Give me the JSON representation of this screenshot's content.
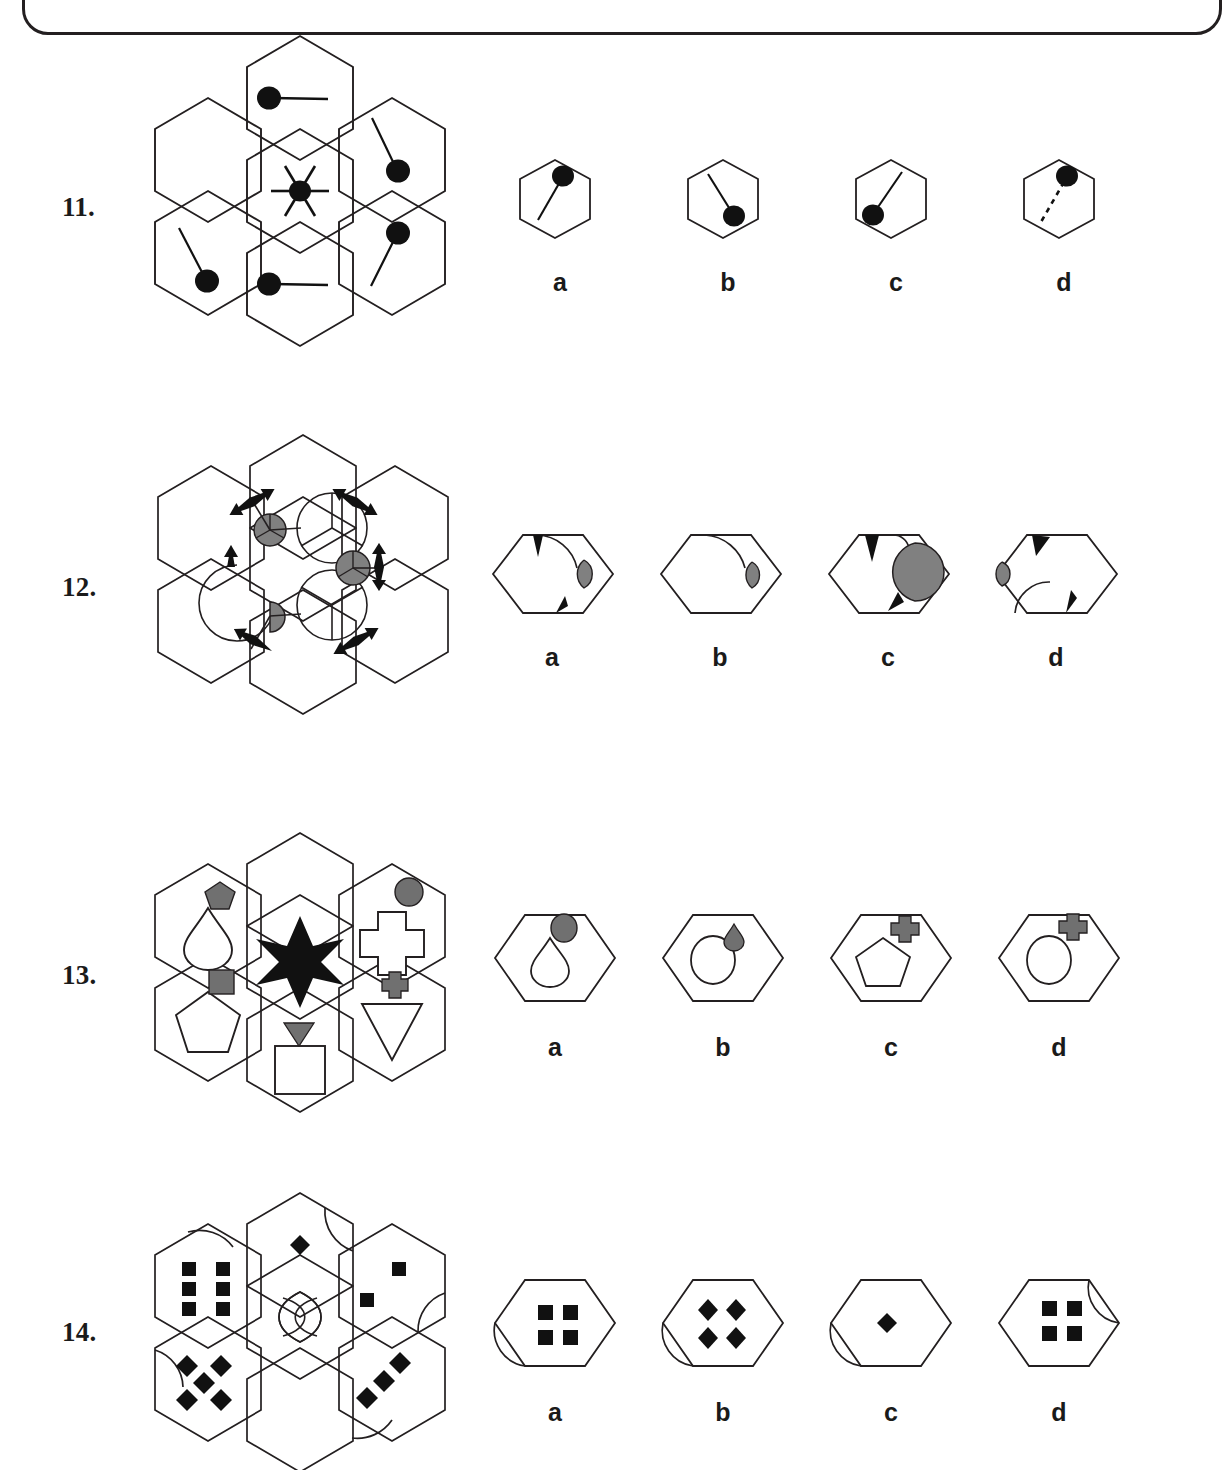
{
  "page": {
    "border": "rounded-rectangle-top",
    "background_color": "#ffffff",
    "ink_color": "#231f20",
    "gray_fill": "#808080",
    "gray_fill_dark": "#707070"
  },
  "questions": [
    {
      "number": "11.",
      "matrix_type": "hexagon-flower-7",
      "description": "Seven hexagons in a flower arrangement; centre hexagon has a filled dot with six radiating spokes; five outer hexagons each contain a filled dot with a single tail line; the upper-left hexagon is empty (the missing piece).",
      "cells": [
        {
          "position": "top",
          "content": "dot-with-line-right"
        },
        {
          "position": "upper-right",
          "content": "dot-with-line-up-left"
        },
        {
          "position": "lower-right",
          "content": "dot-with-line-down-left"
        },
        {
          "position": "bottom",
          "content": "dot-with-line-right"
        },
        {
          "position": "lower-left",
          "content": "dot-with-line-up-right"
        },
        {
          "position": "upper-left",
          "content": "empty"
        },
        {
          "position": "center",
          "content": "dot-with-six-spokes"
        }
      ],
      "options": [
        {
          "label": "a",
          "content": "dot-top-right-with-line-to-lower-left"
        },
        {
          "label": "b",
          "content": "dot-lower-right-with-line-to-upper-left"
        },
        {
          "label": "c",
          "content": "dot-lower-left-with-line-to-upper-right"
        },
        {
          "label": "d",
          "content": "dot-top-right-with-dashed-line-to-lower-left"
        }
      ]
    },
    {
      "number": "12.",
      "matrix_type": "hexagon-flower-7",
      "description": "Seven hexagons; the central hexagon's vertices carry circles divided into three sectors and grey part-discs; its edge midpoints carry black double-headed arrows; the upper-left region is the missing piece.",
      "cells": [
        {
          "position": "top-left-vertex",
          "content": "grey-circle-3-sector"
        },
        {
          "position": "top-right-vertex",
          "content": "circle-3-sector"
        },
        {
          "position": "right-vertex",
          "content": "grey-circle-3-sector"
        },
        {
          "position": "bottom-right-vertex",
          "content": "circle-3-sector"
        },
        {
          "position": "bottom-left-vertex",
          "content": "grey-half-disc"
        },
        {
          "position": "left-vertex",
          "content": "large-arc"
        },
        {
          "position": "edges",
          "content": "black-double-arrows"
        }
      ],
      "options": [
        {
          "label": "a",
          "content": "arrow-top-left, arc-top-right, grey-lens-right, arrow-bottom"
        },
        {
          "label": "b",
          "content": "arc-top-right, grey-lens-right"
        },
        {
          "label": "c",
          "content": "arrow-top-left, small-arc-top, large-grey-lens-right, arrow-bottom-right"
        },
        {
          "label": "d",
          "content": "arrow-top-left, grey-lens-left, arc-bottom-left, arrow-bottom-right"
        }
      ]
    },
    {
      "number": "13.",
      "matrix_type": "hexagon-flower-7",
      "description": "Seven hexagons; centre holds a black six-pointed star; each outer hexagon holds a white outlined shape with a small grey shape beside it; the top hexagon is empty (the missing piece).",
      "cells": [
        {
          "position": "top",
          "content": "empty"
        },
        {
          "position": "upper-left",
          "content": "white-teardrop with grey-pentagon"
        },
        {
          "position": "upper-right",
          "content": "white-cross with grey-circle"
        },
        {
          "position": "lower-left",
          "content": "white-pentagon with grey-square"
        },
        {
          "position": "lower-right",
          "content": "white-triangle-down with grey-cross"
        },
        {
          "position": "bottom",
          "content": "white-square with grey-triangle-down"
        },
        {
          "position": "center",
          "content": "black-six-pointed-star"
        }
      ],
      "options": [
        {
          "label": "a",
          "content": "white-teardrop with grey-circle"
        },
        {
          "label": "b",
          "content": "white-circle with grey-teardrop"
        },
        {
          "label": "c",
          "content": "white-pentagon with grey-cross"
        },
        {
          "label": "d",
          "content": "white-circle with grey-cross"
        }
      ]
    },
    {
      "number": "14.",
      "matrix_type": "hexagon-flower-7",
      "description": "Seven hexagons with black square and diamond dot patterns and curved arcs cut into the hexagon edges; centre holds a lens/vesica motif; figure is cropped at the bottom of the page.",
      "cells": [
        {
          "position": "top",
          "content": "one-diamond, arc-upper-right"
        },
        {
          "position": "upper-left",
          "content": "six-squares-two-columns, arc-upper-right"
        },
        {
          "position": "upper-right",
          "content": "two-squares, arc-lower-right"
        },
        {
          "position": "lower-left",
          "content": "five-diamonds, arc-upper-left"
        },
        {
          "position": "lower-right",
          "content": "three-diamonds, arc-lower-left"
        },
        {
          "position": "bottom",
          "content": "empty"
        },
        {
          "position": "center",
          "content": "vesica-lens-motif"
        }
      ],
      "options": [
        {
          "label": "a",
          "content": "four-squares with arc-lower-left"
        },
        {
          "label": "b",
          "content": "four-diamonds with arc-lower-left"
        },
        {
          "label": "c",
          "content": "one-diamond with arc-lower-left"
        },
        {
          "label": "d",
          "content": "four-squares with arc-upper-right"
        }
      ]
    }
  ]
}
